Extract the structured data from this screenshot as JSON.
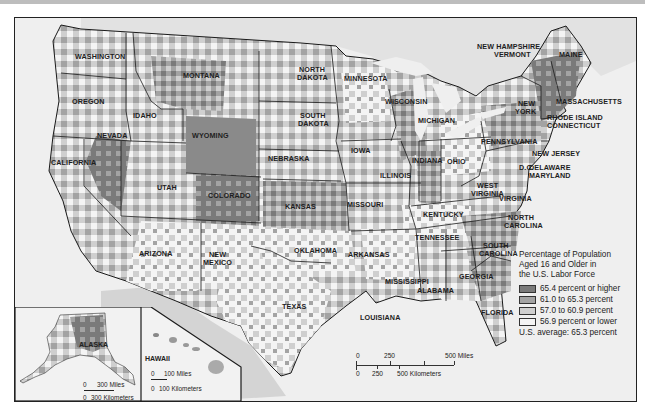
{
  "map": {
    "subject": "Percentage of Population Aged 16 and Older in the U.S. Labor Force",
    "colors": {
      "class1": "#7a7a7a",
      "class2": "#a3a3a3",
      "class3": "#cfcfcf",
      "class4": "#f4f4f4",
      "water": "#efefef",
      "border": "#1a1a1a"
    }
  },
  "legend": {
    "title_line1": "Percentage of Population",
    "title_line2": "Aged 16 and Older in",
    "title_line3": "the U.S. Labor Force",
    "items": [
      {
        "label": "65.4 percent or higher",
        "color": "#7a7a7a"
      },
      {
        "label": "61.0 to 65.3 percent",
        "color": "#a3a3a3"
      },
      {
        "label": "57.0 to 60.9 percent",
        "color": "#cfcfcf"
      },
      {
        "label": "56.9 percent or lower",
        "color": "#f4f4f4"
      }
    ],
    "average": "U.S. average:  65.3 percent"
  },
  "states": {
    "washington": "WASHINGTON",
    "oregon": "OREGON",
    "california": "CALIFORNIA",
    "nevada": "NEVADA",
    "idaho": "IDAHO",
    "montana": "MONTANA",
    "wyoming": "WYOMING",
    "utah": "UTAH",
    "colorado": "COLORADO",
    "arizona": "ARIZONA",
    "new_mexico_1": "NEW",
    "new_mexico_2": "MEXICO",
    "north_dakota_1": "NORTH",
    "north_dakota_2": "DAKOTA",
    "south_dakota_1": "SOUTH",
    "south_dakota_2": "DAKOTA",
    "nebraska": "NEBRASKA",
    "kansas": "KANSAS",
    "oklahoma": "OKLAHOMA",
    "texas": "TEXAS",
    "minnesota": "MINNESOTA",
    "iowa": "IOWA",
    "missouri": "MISSOURI",
    "arkansas": "ARKANSAS",
    "louisiana": "LOUISIANA",
    "wisconsin": "WISCONSIN",
    "illinois": "ILLINOIS",
    "michigan": "MICHIGAN",
    "indiana": "INDIANA",
    "ohio": "OHIO",
    "kentucky": "KENTUCKY",
    "tennessee": "TENNESSEE",
    "mississippi": "MISSISSIPPI",
    "alabama": "ALABAMA",
    "georgia": "GEORGIA",
    "florida": "FLORIDA",
    "south_carolina_1": "SOUTH",
    "south_carolina_2": "CAROLINA",
    "north_carolina_1": "NORTH",
    "north_carolina_2": "CAROLINA",
    "virginia": "VIRGINIA",
    "west_virginia_1": "WEST",
    "west_virginia_2": "VIRGINIA",
    "pennsylvania": "PENNSYLVANIA",
    "new_york_1": "NEW",
    "new_york_2": "YORK",
    "new_jersey": "NEW JERSEY",
    "delaware": "DELAWARE",
    "maryland": "MARYLAND",
    "dc": "D.C.",
    "new_hampshire": "NEW HAMPSHIRE",
    "vermont": "VERMONT",
    "maine": "MAINE",
    "massachusetts": "MASSACHUSETTS",
    "rhode_island": "RHODE ISLAND",
    "connecticut": "CONNECTICUT",
    "alaska": "ALASKA",
    "hawaii": "HAWAII"
  },
  "scale_main": {
    "miles_labels": [
      "0",
      "250",
      "500 Miles"
    ],
    "km_labels": [
      "0",
      "250",
      "500 Kilometers"
    ]
  },
  "scale_alaska": {
    "miles_labels": [
      "0",
      "300 Miles"
    ],
    "km_labels": [
      "0",
      "300 Kilometers"
    ]
  },
  "scale_hawaii": {
    "miles_labels": [
      "0",
      "100 Miles"
    ],
    "km_labels": [
      "0",
      "100 Kilometers"
    ]
  }
}
